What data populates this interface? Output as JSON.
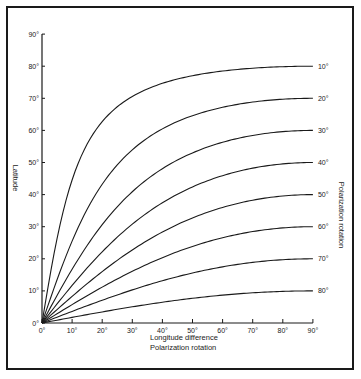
{
  "chart_data": {
    "type": "line",
    "title": "",
    "xlabel": "Longitude difference",
    "xlabel2": "Polarization rotation",
    "ylabel": "Latitude",
    "ylabel_right": "Polarization rotation",
    "xlim": [
      0,
      90
    ],
    "ylim": [
      0,
      90
    ],
    "grid": false,
    "x_ticks": [
      "0°",
      "10°",
      "20°",
      "30°",
      "40°",
      "50°",
      "60°",
      "70°",
      "80°",
      "90°"
    ],
    "y_ticks": [
      "0°",
      "10°",
      "20°",
      "30°",
      "40°",
      "50°",
      "60°",
      "70°",
      "80°",
      "90°"
    ],
    "x": [
      0,
      5,
      10,
      15,
      20,
      30,
      40,
      50,
      60,
      70,
      80,
      90
    ],
    "series": [
      {
        "name": "10°",
        "values": [
          0,
          26.3,
          44.6,
          55.7,
          62.7,
          70.6,
          74.6,
          77.0,
          78.5,
          79.4,
          79.9,
          80
        ]
      },
      {
        "name": "20°",
        "values": [
          0,
          13.5,
          25.5,
          35.4,
          43.2,
          53.9,
          60.5,
          64.6,
          67.2,
          68.8,
          69.7,
          70
        ]
      },
      {
        "name": "30°",
        "values": [
          0,
          8.6,
          16.8,
          24.1,
          30.6,
          40.9,
          48.1,
          53.0,
          56.3,
          58.4,
          59.6,
          60
        ]
      },
      {
        "name": "40°",
        "values": [
          0,
          5.9,
          11.7,
          17.2,
          22.2,
          30.8,
          37.5,
          42.4,
          45.9,
          48.2,
          49.6,
          50
        ]
      },
      {
        "name": "50°",
        "values": [
          0,
          4.2,
          8.3,
          12.3,
          16.0,
          22.8,
          28.3,
          32.7,
          36.0,
          38.3,
          39.6,
          40
        ]
      },
      {
        "name": "60°",
        "values": [
          0,
          2.9,
          5.7,
          8.5,
          11.2,
          16.1,
          20.4,
          23.9,
          26.6,
          28.5,
          29.6,
          30
        ]
      },
      {
        "name": "70°",
        "values": [
          0,
          1.8,
          3.6,
          5.4,
          7.1,
          10.3,
          13.2,
          15.6,
          17.5,
          18.9,
          19.7,
          20
        ]
      },
      {
        "name": "80°",
        "values": [
          0,
          0.9,
          1.8,
          2.6,
          3.5,
          5.0,
          6.5,
          7.7,
          8.7,
          9.4,
          9.8,
          10
        ]
      }
    ],
    "colors": {
      "line": "#1a1a1a",
      "background": "#ffffff"
    }
  }
}
